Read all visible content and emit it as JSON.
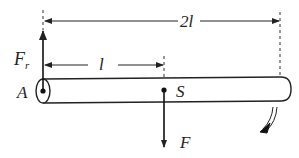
{
  "diagram": {
    "type": "mechanics-free-body",
    "labels": {
      "reaction_force": "F",
      "reaction_force_sub": "r",
      "half_length": "l",
      "full_length": "2l",
      "pivot": "A",
      "center_point": "S",
      "applied_force": "F"
    },
    "dimensions": [
      {
        "name": "half-length",
        "label": "l",
        "from": "A",
        "to": "S"
      },
      {
        "name": "full-length",
        "label": "2l",
        "from": "A",
        "to": "rod-end"
      }
    ],
    "forces": [
      {
        "name": "Fr",
        "direction": "up",
        "at": "A"
      },
      {
        "name": "F",
        "direction": "down",
        "at": "S"
      }
    ],
    "rotation": {
      "direction": "clockwise",
      "indicator": "double-line curved arrow"
    },
    "colors": {
      "stroke": "#222222",
      "background": "#ffffff"
    }
  }
}
